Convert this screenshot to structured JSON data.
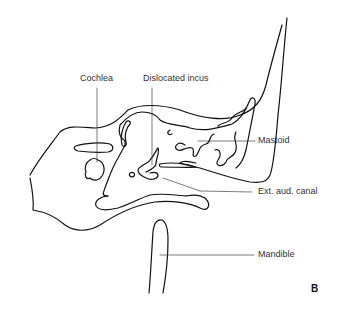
{
  "figure": {
    "panel_label": "B",
    "labels": {
      "cochlea": "Cochlea",
      "incus": "Dislocated incus",
      "mastoid": "Mastoid",
      "canal": "Ext. aud. canal",
      "mandible": "Mandible"
    }
  }
}
